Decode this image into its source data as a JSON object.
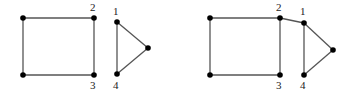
{
  "graphs": [
    {
      "name": "left-graph",
      "nodes": [
        {
          "id": "a",
          "x": 23,
          "y": 18,
          "label": ""
        },
        {
          "id": "2",
          "x": 94,
          "y": 18,
          "label": "2",
          "lx": 90,
          "ly": 11
        },
        {
          "id": "3",
          "x": 94,
          "y": 75,
          "label": "3",
          "lx": 90,
          "ly": 89
        },
        {
          "id": "b",
          "x": 23,
          "y": 75,
          "label": ""
        },
        {
          "id": "1",
          "x": 117,
          "y": 22,
          "label": "1",
          "lx": 113,
          "ly": 15
        },
        {
          "id": "4",
          "x": 117,
          "y": 74,
          "label": "4",
          "lx": 113,
          "ly": 89
        },
        {
          "id": "c",
          "x": 148,
          "y": 48,
          "label": ""
        }
      ],
      "edges": [
        [
          "a",
          "2"
        ],
        [
          "2",
          "3"
        ],
        [
          "3",
          "b"
        ],
        [
          "b",
          "a"
        ],
        [
          "1",
          "4"
        ],
        [
          "1",
          "c"
        ],
        [
          "4",
          "c"
        ]
      ]
    },
    {
      "name": "right-graph",
      "nodes": [
        {
          "id": "a",
          "x": 210,
          "y": 18,
          "label": ""
        },
        {
          "id": "2",
          "x": 280,
          "y": 18,
          "label": "2",
          "lx": 276,
          "ly": 11
        },
        {
          "id": "3",
          "x": 280,
          "y": 75,
          "label": "3",
          "lx": 276,
          "ly": 89
        },
        {
          "id": "b",
          "x": 210,
          "y": 75,
          "label": ""
        },
        {
          "id": "1",
          "x": 304,
          "y": 23,
          "label": "1",
          "lx": 300,
          "ly": 15
        },
        {
          "id": "4",
          "x": 304,
          "y": 75,
          "label": "4",
          "lx": 300,
          "ly": 89
        },
        {
          "id": "c",
          "x": 333,
          "y": 50,
          "label": ""
        }
      ],
      "edges": [
        [
          "a",
          "2"
        ],
        [
          "2",
          "3"
        ],
        [
          "3",
          "b"
        ],
        [
          "b",
          "a"
        ],
        [
          "2",
          "1"
        ],
        [
          "1",
          "4"
        ],
        [
          "1",
          "c"
        ],
        [
          "4",
          "c"
        ]
      ]
    }
  ]
}
